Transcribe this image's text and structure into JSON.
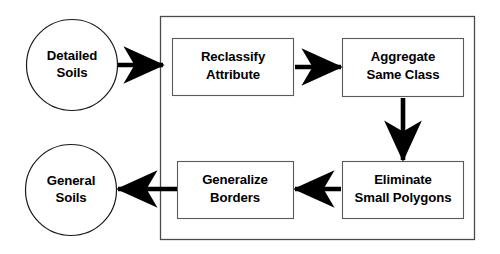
{
  "diagram": {
    "colors": {
      "background": "#ffffff",
      "shape_fill": "#ffffff",
      "shape_stroke": "#5a5a5a",
      "circle_stroke": "#1a1a1a",
      "container_stroke": "#4a4a4a",
      "arrow": "#000000",
      "text": "#000000"
    },
    "inputs": [
      {
        "id": "detailed-soils",
        "shape": "circle",
        "line1": "Detailed",
        "line2": "Soils"
      }
    ],
    "outputs": [
      {
        "id": "general-soils",
        "shape": "circle",
        "line1": "General",
        "line2": "Soils"
      }
    ],
    "process_steps": [
      {
        "id": "reclassify-attribute",
        "order": 1,
        "shape": "rectangle",
        "line1": "Reclassify",
        "line2": "Attribute"
      },
      {
        "id": "aggregate-same-class",
        "order": 2,
        "shape": "rectangle",
        "line1": "Aggregate",
        "line2": "Same Class"
      },
      {
        "id": "eliminate-small-polygons",
        "order": 3,
        "shape": "rectangle",
        "line1": "Eliminate",
        "line2": "Small Polygons"
      },
      {
        "id": "generalize-borders",
        "order": 4,
        "shape": "rectangle",
        "line1": "Generalize",
        "line2": "Borders"
      }
    ],
    "connections": [
      {
        "id": "detailed-to-reclassify",
        "from": "detailed-soils",
        "to": "reclassify-attribute",
        "direction": "right"
      },
      {
        "id": "reclassify-to-aggregate",
        "from": "reclassify-attribute",
        "to": "aggregate-same-class",
        "direction": "right"
      },
      {
        "id": "aggregate-to-eliminate",
        "from": "aggregate-same-class",
        "to": "eliminate-small-polygons",
        "direction": "down"
      },
      {
        "id": "eliminate-to-generalize",
        "from": "eliminate-small-polygons",
        "to": "generalize-borders",
        "direction": "left"
      },
      {
        "id": "generalize-to-general",
        "from": "generalize-borders",
        "to": "general-soils",
        "direction": "left"
      }
    ]
  }
}
